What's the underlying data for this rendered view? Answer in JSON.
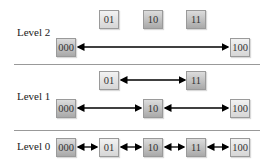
{
  "levels": [
    {
      "label": "Level 2",
      "nodes_top": [
        "01",
        "10",
        "11"
      ],
      "nodes_bottom": [
        "000",
        "100"
      ]
    },
    {
      "label": "Level 1",
      "nodes_top": [
        "01",
        "11"
      ],
      "nodes_bottom": [
        "000",
        "10",
        "100"
      ]
    },
    {
      "label": "Level 0",
      "nodes": [
        "000",
        "01",
        "10",
        "11",
        "100"
      ]
    }
  ],
  "colors": {
    "light_box": "#e4e4e4",
    "dark_box": "#bdbdbd",
    "separator": "#999999",
    "arrow": "#000000"
  }
}
